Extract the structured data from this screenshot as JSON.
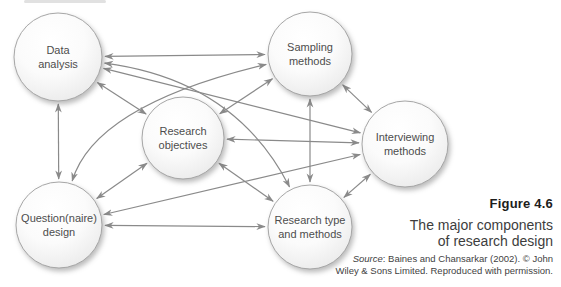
{
  "colors": {
    "arrow": "#8a8a8a",
    "circle_stroke": "#a6a6a6",
    "circle_fill_top": "#ffffff",
    "circle_fill_edge": "#e8e8e8",
    "node_text": "#4d4d4d",
    "figure_label_text": "#1d1d1b",
    "caption_text": "#3d3d3d"
  },
  "diagram": {
    "nodes": [
      {
        "id": "da",
        "label_lines": [
          "Data",
          "analysis"
        ],
        "x": 58,
        "y": 57,
        "r": 44
      },
      {
        "id": "sm",
        "label_lines": [
          "Sampling",
          "methods"
        ],
        "x": 310,
        "y": 54,
        "r": 42
      },
      {
        "id": "ro",
        "label_lines": [
          "Research",
          "objectives"
        ],
        "x": 183,
        "y": 138,
        "r": 41
      },
      {
        "id": "im",
        "label_lines": [
          "Interviewing",
          "methods"
        ],
        "x": 405,
        "y": 144,
        "r": 43
      },
      {
        "id": "qd",
        "label_lines": [
          "Question(naire)",
          "design"
        ],
        "x": 59,
        "y": 225,
        "r": 43
      },
      {
        "id": "rt",
        "label_lines": [
          "Research type",
          "and methods"
        ],
        "x": 310,
        "y": 227,
        "r": 42
      }
    ],
    "edges": [
      {
        "from": "da",
        "to": "sm"
      },
      {
        "from": "da",
        "to": "ro"
      },
      {
        "from": "da",
        "to": "im"
      },
      {
        "from": "da",
        "to": "qd"
      },
      {
        "from": "da",
        "to": "rt",
        "ctrl": [
          235,
          80
        ]
      },
      {
        "from": "sm",
        "to": "ro"
      },
      {
        "from": "sm",
        "to": "im"
      },
      {
        "from": "sm",
        "to": "rt"
      },
      {
        "from": "sm",
        "to": "qd",
        "ctrl": [
          95,
          105
        ]
      },
      {
        "from": "ro",
        "to": "im"
      },
      {
        "from": "ro",
        "to": "qd"
      },
      {
        "from": "ro",
        "to": "rt"
      },
      {
        "from": "im",
        "to": "qd"
      },
      {
        "from": "im",
        "to": "rt"
      },
      {
        "from": "qd",
        "to": "rt"
      }
    ],
    "arrow_style": "double-headed"
  },
  "caption": {
    "figure_label": "Figure 4.6",
    "title_line1": "The major components",
    "title_line2": "of research design",
    "source_word": "Source",
    "source_line1_rest": ": Baines and Chansarkar (2002). © John",
    "source_line2": "Wiley & Sons Limited. Reproduced with permission."
  }
}
